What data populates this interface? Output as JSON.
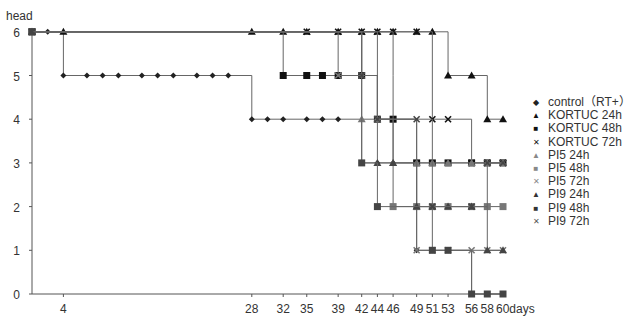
{
  "chart_data": {
    "type": "line",
    "step": true,
    "title": "",
    "ylabel": "head",
    "xlabel": "days",
    "xlim": [
      0,
      60
    ],
    "ylim": [
      0,
      6
    ],
    "yticks": [
      0,
      1,
      2,
      3,
      4,
      5,
      6
    ],
    "xticks": [
      4,
      28,
      32,
      35,
      39,
      42,
      44,
      46,
      49,
      51,
      53,
      56,
      58,
      60
    ],
    "grid": false,
    "legend_position": "right",
    "series": [
      {
        "name": "control（RT+）",
        "marker": "diamond",
        "color": "#222222",
        "points": [
          [
            0,
            6
          ],
          [
            2,
            6
          ],
          [
            4,
            6
          ],
          [
            4,
            5
          ],
          [
            7,
            5
          ],
          [
            9,
            5
          ],
          [
            11,
            5
          ],
          [
            14,
            5
          ],
          [
            16,
            5
          ],
          [
            18,
            5
          ],
          [
            21,
            5
          ],
          [
            23,
            5
          ],
          [
            25,
            5
          ],
          [
            28,
            5
          ],
          [
            28,
            4
          ],
          [
            30,
            4
          ],
          [
            32,
            4
          ],
          [
            35,
            4
          ],
          [
            37,
            4
          ],
          [
            39,
            4
          ],
          [
            42,
            4
          ],
          [
            42,
            3
          ],
          [
            44,
            3
          ],
          [
            46,
            3
          ],
          [
            49,
            3
          ],
          [
            49,
            1
          ],
          [
            51,
            1
          ],
          [
            53,
            1
          ],
          [
            56,
            1
          ],
          [
            56,
            0
          ],
          [
            58,
            0
          ],
          [
            60,
            0
          ]
        ]
      },
      {
        "name": "KORTUC 24h",
        "marker": "triangle",
        "color": "#111111",
        "points": [
          [
            0,
            6
          ],
          [
            4,
            6
          ],
          [
            28,
            6
          ],
          [
            32,
            6
          ],
          [
            35,
            6
          ],
          [
            39,
            6
          ],
          [
            42,
            6
          ],
          [
            44,
            6
          ],
          [
            46,
            6
          ],
          [
            49,
            6
          ],
          [
            51,
            6
          ],
          [
            53,
            6
          ],
          [
            53,
            5
          ],
          [
            56,
            5
          ],
          [
            58,
            5
          ],
          [
            58,
            4
          ],
          [
            60,
            4
          ]
        ]
      },
      {
        "name": "KORTUC 48h",
        "marker": "square",
        "color": "#111111",
        "points": [
          [
            0,
            6
          ],
          [
            32,
            6
          ],
          [
            32,
            5
          ],
          [
            35,
            5
          ],
          [
            37,
            5
          ],
          [
            39,
            5
          ],
          [
            42,
            5
          ],
          [
            44,
            5
          ],
          [
            44,
            4
          ],
          [
            46,
            4
          ],
          [
            49,
            4
          ],
          [
            49,
            3
          ],
          [
            51,
            3
          ],
          [
            53,
            3
          ],
          [
            56,
            3
          ],
          [
            58,
            3
          ],
          [
            60,
            3
          ]
        ]
      },
      {
        "name": "KORTUC 72h",
        "marker": "x",
        "color": "#111111",
        "points": [
          [
            0,
            6
          ],
          [
            35,
            6
          ],
          [
            39,
            6
          ],
          [
            42,
            6
          ],
          [
            44,
            6
          ],
          [
            46,
            6
          ],
          [
            49,
            6
          ],
          [
            51,
            6
          ],
          [
            51,
            4
          ],
          [
            53,
            4
          ],
          [
            56,
            4
          ],
          [
            56,
            3
          ],
          [
            58,
            3
          ],
          [
            60,
            3
          ]
        ]
      },
      {
        "name": "PI5 24h",
        "marker": "triangle",
        "color": "#777777",
        "points": [
          [
            0,
            6
          ],
          [
            42,
            6
          ],
          [
            42,
            4
          ],
          [
            44,
            4
          ],
          [
            46,
            4
          ],
          [
            46,
            3
          ],
          [
            49,
            3
          ],
          [
            51,
            3
          ],
          [
            53,
            3
          ],
          [
            56,
            3
          ],
          [
            58,
            3
          ],
          [
            60,
            3
          ]
        ]
      },
      {
        "name": "PI5 48h",
        "marker": "square",
        "color": "#777777",
        "points": [
          [
            0,
            6
          ],
          [
            46,
            6
          ],
          [
            46,
            5
          ],
          [
            46,
            4
          ],
          [
            46,
            2
          ],
          [
            49,
            2
          ],
          [
            51,
            2
          ],
          [
            53,
            2
          ],
          [
            56,
            2
          ],
          [
            58,
            2
          ],
          [
            60,
            2
          ]
        ]
      },
      {
        "name": "PI5 72h",
        "marker": "x",
        "color": "#777777",
        "points": [
          [
            0,
            6
          ],
          [
            39,
            6
          ],
          [
            39,
            5
          ],
          [
            42,
            5
          ],
          [
            44,
            5
          ],
          [
            44,
            4
          ],
          [
            49,
            4
          ],
          [
            49,
            1
          ],
          [
            51,
            1
          ],
          [
            53,
            1
          ],
          [
            56,
            1
          ],
          [
            58,
            1
          ],
          [
            60,
            1
          ]
        ]
      },
      {
        "name": "PI9 24h",
        "marker": "triangle",
        "color": "#444444",
        "points": [
          [
            0,
            6
          ],
          [
            44,
            6
          ],
          [
            44,
            3
          ],
          [
            46,
            3
          ],
          [
            49,
            3
          ],
          [
            49,
            2
          ],
          [
            51,
            2
          ],
          [
            53,
            2
          ],
          [
            56,
            2
          ],
          [
            58,
            2
          ],
          [
            58,
            1
          ],
          [
            60,
            1
          ]
        ]
      },
      {
        "name": "PI9 48h",
        "marker": "square",
        "color": "#444444",
        "points": [
          [
            0,
            6
          ],
          [
            42,
            6
          ],
          [
            42,
            5
          ],
          [
            42,
            3
          ],
          [
            44,
            3
          ],
          [
            44,
            2
          ],
          [
            51,
            2
          ],
          [
            51,
            1
          ],
          [
            53,
            1
          ],
          [
            56,
            1
          ],
          [
            56,
            0
          ],
          [
            58,
            0
          ],
          [
            60,
            0
          ]
        ]
      },
      {
        "name": "PI9 72h",
        "marker": "x",
        "color": "#444444",
        "points": [
          [
            0,
            6
          ],
          [
            42,
            6
          ],
          [
            42,
            5
          ],
          [
            44,
            5
          ],
          [
            44,
            4
          ],
          [
            49,
            4
          ],
          [
            51,
            4
          ],
          [
            51,
            2
          ],
          [
            56,
            2
          ],
          [
            58,
            2
          ],
          [
            58,
            3
          ],
          [
            60,
            3
          ]
        ]
      }
    ]
  },
  "legend": {
    "items": [
      {
        "label": "control（RT+）",
        "marker": "◆",
        "color": "#222"
      },
      {
        "label": "KORTUC 24h",
        "marker": "▲",
        "color": "#111"
      },
      {
        "label": "KORTUC 48h",
        "marker": "■",
        "color": "#111"
      },
      {
        "label": "KORTUC 72h",
        "marker": "✕",
        "color": "#111"
      },
      {
        "label": "PI5 24h",
        "marker": "▲",
        "color": "#888"
      },
      {
        "label": "PI5 48h",
        "marker": "■",
        "color": "#888"
      },
      {
        "label": "PI5 72h",
        "marker": "✕",
        "color": "#888"
      },
      {
        "label": "PI9 24h",
        "marker": "▲",
        "color": "#333"
      },
      {
        "label": "PI9 48h",
        "marker": "■",
        "color": "#333"
      },
      {
        "label": "PI9 72h",
        "marker": "✕",
        "color": "#555"
      }
    ]
  },
  "axes": {
    "ylabel": "head",
    "xlabel_suffix": "days"
  }
}
